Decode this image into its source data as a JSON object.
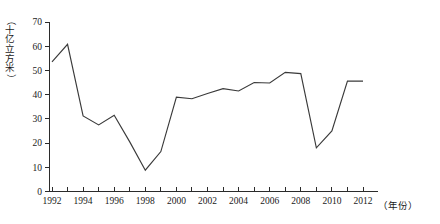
{
  "chart_data": {
    "type": "line",
    "title": "",
    "subtitle": "",
    "xlabel": "年份",
    "ylabel": "（十亿立方米）",
    "ylabel_chars": [
      "（",
      "十",
      "亿",
      "立",
      "方",
      "米",
      "）"
    ],
    "x": [
      1992,
      1993,
      1994,
      1995,
      1996,
      1997,
      1998,
      1999,
      2000,
      2001,
      2002,
      2003,
      2004,
      2005,
      2006,
      2007,
      2008,
      2009,
      2010,
      2011,
      2012
    ],
    "values": [
      53.5,
      60.8,
      31.2,
      27.5,
      31.5,
      20.5,
      8.8,
      16.5,
      39.0,
      38.3,
      40.5,
      42.5,
      41.5,
      45.0,
      44.8,
      49.2,
      48.7,
      18.0,
      25.0,
      45.6,
      45.6
    ],
    "series": [
      {
        "name": "天然气",
        "values": [
          53.5,
          60.8,
          31.2,
          27.5,
          31.5,
          20.5,
          8.8,
          16.5,
          39.0,
          38.3,
          40.5,
          42.5,
          41.5,
          45.0,
          44.8,
          49.2,
          48.7,
          18.0,
          25.0,
          45.6,
          45.6
        ]
      }
    ],
    "xlim": [
      1992,
      2012
    ],
    "ylim": [
      0,
      70
    ],
    "ytick_values": [
      0,
      10,
      20,
      30,
      40,
      50,
      60,
      70
    ],
    "ytick_labels": [
      "0",
      "10",
      "20",
      "30",
      "40",
      "50",
      "60",
      "70"
    ],
    "xtick_values": [
      1992,
      1993,
      1994,
      1995,
      1996,
      1997,
      1998,
      1999,
      2000,
      2001,
      2002,
      2003,
      2004,
      2005,
      2006,
      2007,
      2008,
      2009,
      2010,
      2011,
      2012
    ],
    "xtick_labeled": [
      1992,
      1994,
      1996,
      1998,
      2000,
      2002,
      2004,
      2006,
      2008,
      2010,
      2012
    ],
    "xtick_labels": [
      "1992",
      "1994",
      "1996",
      "1998",
      "2000",
      "2002",
      "2004",
      "2006",
      "2008",
      "2010",
      "2012"
    ],
    "grid": false,
    "legend": false,
    "legend_position": "none",
    "line_color": "#3a3a3a",
    "axis_color": "#2b2b2b",
    "background_color": "#ffffff",
    "x_unit_suffix": "（年份）"
  }
}
